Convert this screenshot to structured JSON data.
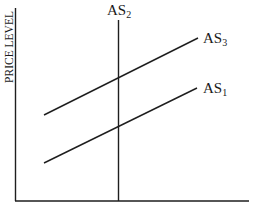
{
  "diagram": {
    "type": "aggregate-supply-diagram",
    "y_axis": {
      "label": "PRICE LEVEL"
    },
    "x_axis": {
      "label": ""
    },
    "curves": [
      {
        "id": "as1",
        "name": "AS",
        "subscript": "1",
        "kind": "upward-sloping",
        "from": [
          44,
          163
        ],
        "to": [
          197,
          88
        ]
      },
      {
        "id": "as2",
        "name": "AS",
        "subscript": "2",
        "kind": "vertical",
        "from": [
          118,
          20
        ],
        "to": [
          118,
          201
        ]
      },
      {
        "id": "as3",
        "name": "AS",
        "subscript": "3",
        "kind": "upward-sloping",
        "from": [
          44,
          115
        ],
        "to": [
          198,
          38
        ]
      }
    ],
    "line_color": "#1e1e1e",
    "background": "#ffffff"
  }
}
